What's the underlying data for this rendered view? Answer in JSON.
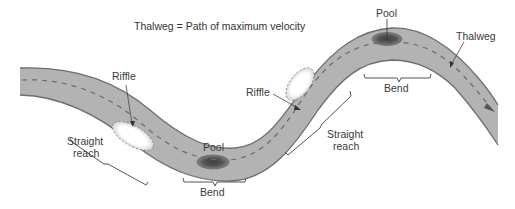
{
  "title": "Thalweg = Path of maximum velocity",
  "labels": {
    "riffle_left": "Riffle",
    "riffle_right": "Riffle",
    "pool_bottom": "Pool",
    "pool_top": "Pool",
    "thalweg": "Thalweg",
    "bend_bottom": "Bend",
    "bend_top": "Bend",
    "straight_left_line1": "Straight",
    "straight_left_line2": "reach",
    "straight_right_line1": "Straight",
    "straight_right_line2": "reach"
  },
  "colors": {
    "river_fill": "#b3b3b3",
    "river_edge": "#6e6e6e",
    "thalweg_dash": "#6a6a6a",
    "pool_outer": "#7a7a7a",
    "pool_inner": "#4a4a4a",
    "riffle_fill": "#ffffff",
    "text": "#3a3a3a"
  }
}
